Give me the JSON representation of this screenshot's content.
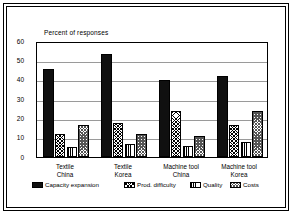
{
  "chart_data": {
    "type": "bar",
    "title": "",
    "axis_title": "Percent of responses",
    "xlabel": "",
    "ylabel": "Percent of responses",
    "ylim": [
      0,
      60
    ],
    "yticks": [
      0,
      10,
      20,
      30,
      40,
      50,
      60
    ],
    "grid": true,
    "legend_position": "bottom",
    "categories": [
      "Textile\nChina",
      "Textile\nKorea",
      "Machine tool\nChina",
      "Machine tool\nKorea"
    ],
    "category_lines": [
      [
        "Textile",
        "China"
      ],
      [
        "Textile",
        "Korea"
      ],
      [
        "Machine tool",
        "China"
      ],
      [
        "Machine tool",
        "Korea"
      ]
    ],
    "series": [
      {
        "name": "Capacity expansion",
        "pattern": "solid-black",
        "values": [
          45.5,
          53.5,
          40.0,
          42.0
        ]
      },
      {
        "name": "Prod. difficulty",
        "pattern": "crosshatch",
        "values": [
          12.0,
          17.5,
          24.0,
          16.5
        ]
      },
      {
        "name": "Quality",
        "pattern": "vertical-lines",
        "values": [
          5.0,
          6.5,
          5.5,
          8.0
        ]
      },
      {
        "name": "Costs",
        "pattern": "checkered",
        "values": [
          16.5,
          12.0,
          11.0,
          24.0
        ]
      }
    ]
  },
  "legend": {
    "items": [
      {
        "label": "Capacity expansion"
      },
      {
        "label": "Prod. difficulty"
      },
      {
        "label": "Quality"
      },
      {
        "label": "Costs"
      }
    ]
  },
  "colors": {
    "series1": "#101010",
    "grid": "#9a9a9a",
    "axis": "#000000",
    "background": "#ffffff"
  }
}
